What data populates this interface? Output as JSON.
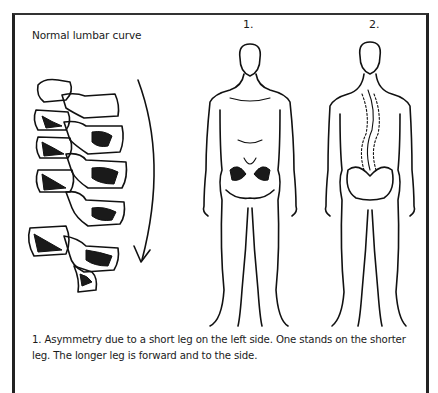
{
  "figure": {
    "title": "Normal lumbar curve",
    "labels": [
      "1.",
      "2."
    ],
    "caption": "1. Asymmetry due to a short leg on the left side. One stands on the shorter leg. The longer leg is forward and to the side.",
    "illustrations": [
      {
        "name": "lumbar-spine-vertebrae",
        "description": "Side view of five lumbar vertebrae with curved arrow"
      },
      {
        "name": "figure-1-front-view",
        "description": "Standing man, front view, showing pelvis"
      },
      {
        "name": "figure-2-back-view",
        "description": "Standing man, back view, showing curved spine and pelvis"
      }
    ],
    "colors": {
      "ink": "#111111",
      "frame": "#222222",
      "background": "#ffffff"
    }
  }
}
